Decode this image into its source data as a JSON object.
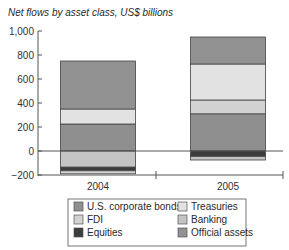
{
  "chart_data": {
    "type": "bar",
    "stacked": true,
    "title": "Net flows by asset class, US$ billions",
    "xlabel": "",
    "ylabel": "",
    "ylim": [
      -200,
      1000
    ],
    "yticks": [
      -200,
      0,
      200,
      400,
      600,
      800,
      1000
    ],
    "ytick_labels": [
      "−200",
      "0",
      "200",
      "400",
      "600",
      "800",
      "1,000"
    ],
    "categories": [
      "2004",
      "2005"
    ],
    "grid": false,
    "legend_position": "bottom",
    "series": [
      {
        "name": "U.S. corporate bonds",
        "color": "#8f8f8f",
        "values": [
          225,
          310
        ]
      },
      {
        "name": "Treasuries",
        "color": "#e2e2e2",
        "values": [
          125,
          300
        ]
      },
      {
        "name": "FDI",
        "color": "#d2d2d2",
        "values": [
          -25,
          115
        ]
      },
      {
        "name": "Banking",
        "color": "#c4c4c4",
        "values": [
          -135,
          -30
        ]
      },
      {
        "name": "Equities",
        "color": "#3c3c3c",
        "values": [
          -30,
          -45
        ]
      },
      {
        "name": "Official assets",
        "color": "#929292",
        "values": [
          400,
          225
        ]
      }
    ],
    "stack_order": {
      "positive": [
        "U.S. corporate bonds",
        "FDI",
        "Treasuries",
        "Official assets"
      ],
      "negative": [
        "Banking",
        "Equities",
        "FDI"
      ]
    },
    "totals_top": [
      750,
      950
    ],
    "totals_bottom": [
      -190,
      -75
    ]
  },
  "legend": {
    "items": [
      {
        "label": "U.S. corporate bonds",
        "color": "#8f8f8f"
      },
      {
        "label": "Treasuries",
        "color": "#e2e2e2"
      },
      {
        "label": "FDI",
        "color": "#d2d2d2"
      },
      {
        "label": "Banking",
        "color": "#c4c4c4"
      },
      {
        "label": "Equities",
        "color": "#3c3c3c"
      },
      {
        "label": "Official assets",
        "color": "#929292"
      }
    ]
  }
}
